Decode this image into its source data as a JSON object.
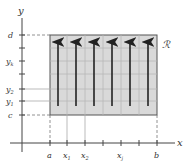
{
  "figure": {
    "region_label": "ℛ",
    "axes": {
      "x_label": "x",
      "y_label": "y"
    },
    "x_ticks": [
      {
        "label": "a",
        "sub": "",
        "x": 50
      },
      {
        "label": "x",
        "sub": "1",
        "x": 67
      },
      {
        "label": "x",
        "sub": "2",
        "x": 85
      },
      {
        "label": "",
        "sub": "",
        "x": 103
      },
      {
        "label": "x",
        "sub": "j",
        "x": 121
      },
      {
        "label": "",
        "sub": "",
        "x": 139
      },
      {
        "label": "b",
        "sub": "",
        "x": 157
      }
    ],
    "y_ticks": [
      {
        "label": "d",
        "sub": "",
        "y": 35
      },
      {
        "label": "",
        "sub": "",
        "y": 48
      },
      {
        "label": "y",
        "sub": "k",
        "y": 61
      },
      {
        "label": "",
        "sub": "",
        "y": 74
      },
      {
        "label": "y",
        "sub": "2",
        "y": 89
      },
      {
        "label": "y",
        "sub": "1",
        "y": 101
      },
      {
        "label": "c",
        "sub": "",
        "y": 115
      }
    ],
    "arrows_count": 6,
    "colors": {
      "fill": "#d9d9d9",
      "grid": "#b8b8b8",
      "border": "#555555",
      "arrow": "#222222",
      "axis": "#444444"
    }
  }
}
